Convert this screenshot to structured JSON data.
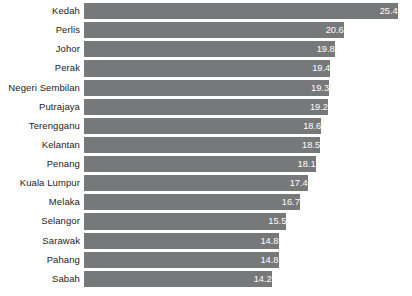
{
  "chart_data": {
    "type": "bar",
    "orientation": "horizontal",
    "title": "",
    "subtitle": "",
    "xlabel": "",
    "ylabel": "",
    "grid": false,
    "legend": false,
    "legend_position": "none",
    "axis_truncated": true,
    "value_label_position": "inside-end",
    "value_label_color": "#ffffff",
    "bar_color": "#77787a",
    "background_color": "#ffffff",
    "category_label_color": "#222222",
    "xlim": [
      7.5,
      25.4
    ],
    "categories": [
      "Kedah",
      "Perlis",
      "Johor",
      "Perak",
      "Negeri Sembilan",
      "Putrajaya",
      "Terengganu",
      "Kelantan",
      "Penang",
      "Kuala Lumpur",
      "Melaka",
      "Selangor",
      "Sarawak",
      "Pahang",
      "Sabah"
    ],
    "values": [
      25.4,
      20.6,
      19.8,
      19.4,
      19.3,
      19.2,
      18.6,
      18.5,
      18.1,
      17.4,
      16.7,
      15.5,
      14.8,
      14.8,
      14.2
    ],
    "value_labels": [
      "25.4",
      "20.6",
      "19.8",
      "19.4",
      "19.3",
      "19.2",
      "18.6",
      "18.5",
      "18.1",
      "17.4",
      "16.7",
      "15.5",
      "14.8",
      "14.8",
      "14.2"
    ],
    "rows": [
      {
        "category": "Kedah",
        "value": 25.4,
        "label": "25.4"
      },
      {
        "category": "Perlis",
        "value": 20.6,
        "label": "20.6"
      },
      {
        "category": "Johor",
        "value": 19.8,
        "label": "19.8"
      },
      {
        "category": "Perak",
        "value": 19.4,
        "label": "19.4"
      },
      {
        "category": "Negeri Sembilan",
        "value": 19.3,
        "label": "19.3"
      },
      {
        "category": "Putrajaya",
        "value": 19.2,
        "label": "19.2"
      },
      {
        "category": "Terengganu",
        "value": 18.6,
        "label": "18.6"
      },
      {
        "category": "Kelantan",
        "value": 18.5,
        "label": "18.5"
      },
      {
        "category": "Penang",
        "value": 18.1,
        "label": "18.1"
      },
      {
        "category": "Kuala Lumpur",
        "value": 17.4,
        "label": "17.4"
      },
      {
        "category": "Melaka",
        "value": 16.7,
        "label": "16.7"
      },
      {
        "category": "Selangor",
        "value": 15.5,
        "label": "15.5"
      },
      {
        "category": "Sarawak",
        "value": 14.8,
        "label": "14.8"
      },
      {
        "category": "Pahang",
        "value": 14.8,
        "label": "14.8"
      },
      {
        "category": "Sabah",
        "value": 14.2,
        "label": "14.2"
      }
    ]
  }
}
